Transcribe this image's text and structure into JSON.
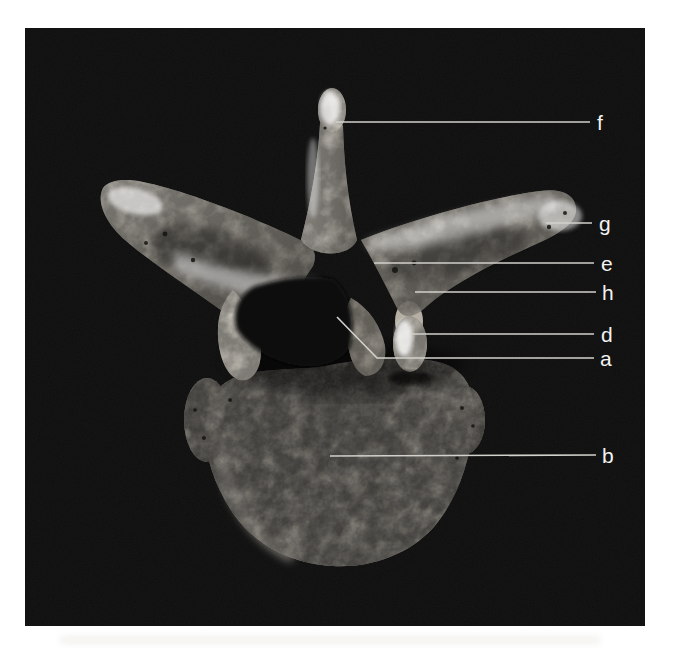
{
  "figure": {
    "kind": "labeled specimen photograph",
    "photo_background": "#0b0b0b",
    "page_background": "#ffffff",
    "leader_line_color": "#d2d1cb",
    "label_color": "#f3f3f1",
    "labels": [
      {
        "letter": "f",
        "points": [
          [
            311,
            94
          ],
          [
            565,
            94
          ]
        ],
        "text_pos": [
          572,
          94
        ]
      },
      {
        "letter": "g",
        "points": [
          [
            521,
            195
          ],
          [
            567,
            195
          ]
        ],
        "text_pos": [
          574,
          195
        ]
      },
      {
        "letter": "e",
        "points": [
          [
            349,
            235
          ],
          [
            569,
            235
          ]
        ],
        "text_pos": [
          576,
          235
        ]
      },
      {
        "letter": "h",
        "points": [
          [
            390,
            264
          ],
          [
            571,
            264
          ]
        ],
        "text_pos": [
          577,
          264
        ]
      },
      {
        "letter": "d",
        "points": [
          [
            387,
            306
          ],
          [
            569,
            306
          ]
        ],
        "text_pos": [
          576,
          306
        ]
      },
      {
        "letter": "a",
        "points": [
          [
            312,
            289
          ],
          [
            352,
            330
          ],
          [
            569,
            330
          ]
        ],
        "text_pos": [
          575,
          330
        ]
      },
      {
        "letter": "b",
        "points": [
          [
            305,
            428
          ],
          [
            571,
            427
          ]
        ],
        "text_pos": [
          577,
          427
        ]
      }
    ]
  }
}
